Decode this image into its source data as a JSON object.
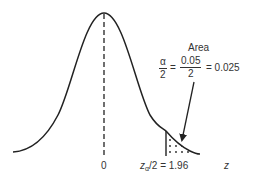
{
  "diagram": {
    "type": "normal-distribution-two-tailed-critical-region",
    "curve": "standard normal density",
    "mean_label": "0",
    "axis_label": "z",
    "critical_value_label": {
      "prefix": "z",
      "subscript": "α",
      "suffix": "/2 = 1.96"
    },
    "annotation": {
      "title": "Area",
      "lhs_num": "α",
      "lhs_den": "2",
      "eq1": "=",
      "mid_num": "0.05",
      "mid_den": "2",
      "eq2": "= 0.025"
    },
    "colors": {
      "curve": "#222222",
      "shading_dots": "#222222",
      "background": "#ffffff"
    }
  }
}
